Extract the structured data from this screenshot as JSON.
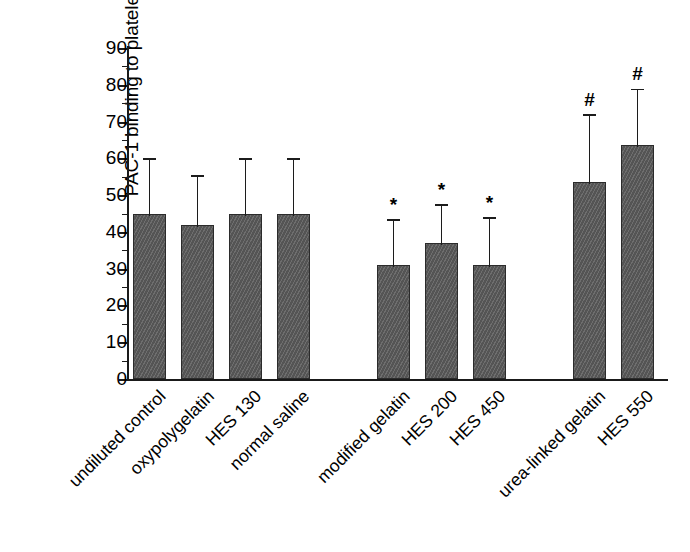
{
  "chart_data": {
    "type": "bar",
    "title": "",
    "xlabel": "",
    "ylabel": "PAC-1 binding to platelets (% gated)",
    "ylim": [
      0,
      90
    ],
    "ytick_step": 10,
    "yticks": [
      "0",
      "10",
      "20",
      "30",
      "40",
      "50",
      "60",
      "70",
      "80",
      "90"
    ],
    "grid": false,
    "legend": "none",
    "bar_color": "#5e5e5e",
    "bar_edge_color": "#2b2b2b",
    "error_bar_type": "upper SD only",
    "categories": [
      "undiluted control",
      "oxypolygelatin",
      "HES 130",
      "normal saline",
      "modified gelatin",
      "HES 200",
      "HES 450",
      "urea-linked gelatin",
      "HES 550"
    ],
    "values": [
      45,
      42,
      45,
      45,
      31,
      37,
      31,
      53.5,
      63.5
    ],
    "error_upper": [
      59.5,
      55,
      59.5,
      59.5,
      43,
      47,
      43.5,
      71.5,
      78.5
    ],
    "annotations": [
      "",
      "",
      "",
      "",
      "*",
      "*",
      "*",
      "#",
      "#"
    ],
    "groups": [
      {
        "label": "",
        "members": [
          "undiluted control",
          "oxypolygelatin",
          "HES 130",
          "normal saline"
        ]
      },
      {
        "label": "",
        "members": [
          "modified gelatin",
          "HES 200",
          "HES 450"
        ]
      },
      {
        "label": "",
        "members": [
          "urea-linked gelatin",
          "HES 550"
        ]
      }
    ]
  },
  "bars": [
    {
      "name": "undiluted control",
      "value": 45,
      "err_top": 59.5,
      "sig": "",
      "x": 133
    },
    {
      "name": "oxypolygelatin",
      "value": 42,
      "err_top": 55,
      "sig": "",
      "x": 181
    },
    {
      "name": "HES 130",
      "value": 45,
      "err_top": 59.5,
      "sig": "",
      "x": 229
    },
    {
      "name": "normal saline",
      "value": 45,
      "err_top": 59.5,
      "sig": "",
      "x": 277
    },
    {
      "name": "modified gelatin",
      "value": 31,
      "err_top": 43,
      "sig": "*",
      "x": 377
    },
    {
      "name": "HES 200",
      "value": 37,
      "err_top": 47,
      "sig": "*",
      "x": 425
    },
    {
      "name": "HES 450",
      "value": 31,
      "err_top": 43.5,
      "sig": "*",
      "x": 473
    },
    {
      "name": "urea-linked gelatin",
      "value": 53.5,
      "err_top": 71.5,
      "sig": "#",
      "x": 573
    },
    {
      "name": "HES 550",
      "value": 63.5,
      "err_top": 78.5,
      "sig": "#",
      "x": 621
    }
  ]
}
